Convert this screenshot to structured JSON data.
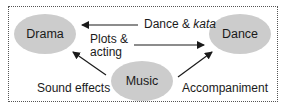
{
  "diagram": {
    "type": "flow",
    "colors": {
      "node_fill": "#cccccc",
      "text": "#1a1a1a",
      "arrow": "#1a1a1a",
      "frame_border": "#555555"
    },
    "nodes": [
      {
        "id": "drama",
        "label": "Drama"
      },
      {
        "id": "dance",
        "label": "Dance"
      },
      {
        "id": "music",
        "label": "Music"
      }
    ],
    "edges": [
      {
        "from": "dance",
        "to": "drama",
        "label_main": "Dance & ",
        "label_italic": "kata"
      },
      {
        "from": "drama",
        "to": "dance",
        "label_line1": "Plots &",
        "label_line2": "acting"
      },
      {
        "from": "music",
        "to": "drama",
        "label": "Sound effects"
      },
      {
        "from": "music",
        "to": "dance",
        "label": "Accompaniment"
      }
    ]
  }
}
